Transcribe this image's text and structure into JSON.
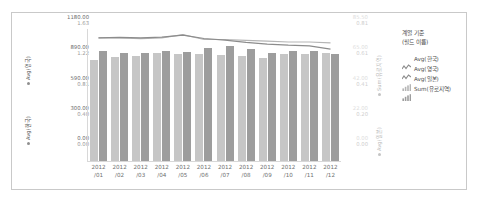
{
  "chart_data": {
    "type": "bar",
    "title": "",
    "subtitle": "",
    "xlabel": "",
    "categories": [
      "2012/01",
      "2012/02",
      "2012/03",
      "2012/04",
      "2012/05",
      "2012/06",
      "2012/07",
      "2012/08",
      "2012/09",
      "2012/10",
      "2012/11",
      "2012/12"
    ],
    "x_tick_labels_line1": [
      "2012",
      "2012",
      "2012",
      "2012",
      "2012",
      "2012",
      "2012",
      "2012",
      "2012",
      "2012",
      "2012",
      "2012"
    ],
    "x_tick_labels_line2": [
      "/01",
      "/02",
      "/03",
      "/04",
      "/05",
      "/06",
      "/07",
      "/08",
      "/09",
      "/10",
      "/11",
      "/12"
    ],
    "grid": false,
    "legend_position": "right",
    "axes": {
      "left_primary": {
        "title": "Avg(영국)",
        "ticks": [
          "1180.00",
          "890.00",
          "590.00",
          "300.00",
          "0.00"
        ],
        "range": [
          0,
          1180
        ]
      },
      "left_secondary": {
        "title": "Avg(한국)",
        "ticks": [
          "1.63",
          "1.22",
          "0.81",
          "0.40",
          "0.00"
        ],
        "range": [
          0,
          1.63
        ]
      },
      "right_primary": {
        "title": "Sum(유로지역)",
        "ticks": [
          "85.50",
          "65.00",
          "42.00",
          "22.00",
          "0.00"
        ],
        "range": [
          0,
          85.5
        ]
      },
      "right_secondary": {
        "title": "Avg(일본)",
        "ticks": [
          "0.81",
          "0.61",
          "0.41",
          "0.20",
          "0.00"
        ],
        "range": [
          0,
          0.81
        ]
      }
    },
    "series": [
      {
        "name": "Avg(한국)",
        "kind": "line",
        "color": "#b5b5b5",
        "axis": "left_secondary",
        "values": [
          1.52,
          1.52,
          1.51,
          1.52,
          1.56,
          1.5,
          1.5,
          1.49,
          1.48,
          1.47,
          1.47,
          1.46
        ]
      },
      {
        "name": "Avg(영국)",
        "kind": "line",
        "color": "#8c8c8c",
        "axis": "left_primary",
        "values": [
          1100,
          1105,
          1100,
          1108,
          1125,
          1095,
          1080,
          1060,
          1045,
          1035,
          1030,
          1000
        ]
      },
      {
        "name": "Avg(일본)",
        "kind": "bar",
        "color": "#c6c6c6",
        "axis": "right_secondary",
        "values": [
          0.62,
          0.64,
          0.645,
          0.66,
          0.655,
          0.655,
          0.65,
          0.645,
          0.635,
          0.655,
          0.655,
          0.66
        ]
      },
      {
        "name": "Sum(유로지역)",
        "kind": "bar",
        "color": "#9d9d9d",
        "axis": "right_primary",
        "values": [
          71.5,
          70.0,
          70.0,
          71.5,
          70.5,
          73.5,
          74.5,
          72.5,
          70.0,
          71.0,
          71.0,
          69.5
        ]
      }
    ]
  },
  "legend": {
    "title_line1": "계열 기준",
    "title_line2": "(필드 이름)",
    "items": [
      {
        "label": "Avg(한국)",
        "icon": "line-chart-icon",
        "color": "#8c8c8c"
      },
      {
        "label": "Avg(영국)",
        "icon": "line-chart-icon",
        "color": "#8c8c8c"
      },
      {
        "label": "Avg(일본)",
        "icon": "bar-chart-icon",
        "color": "#b5b5b5"
      },
      {
        "label": "Sum(유로지역)",
        "icon": "bar-chart-icon",
        "color": "#9d9d9d"
      }
    ]
  },
  "colors": {
    "frame_border": "#c9c9c9",
    "background": "#ffffff",
    "bar_light": "#c6c6c6",
    "bar_dark": "#9d9d9d",
    "line_light": "#b5b5b5",
    "line_dark": "#8c8c8c",
    "tick_dark": "#6e6e6e",
    "tick_faint": "#d4d4d4"
  }
}
